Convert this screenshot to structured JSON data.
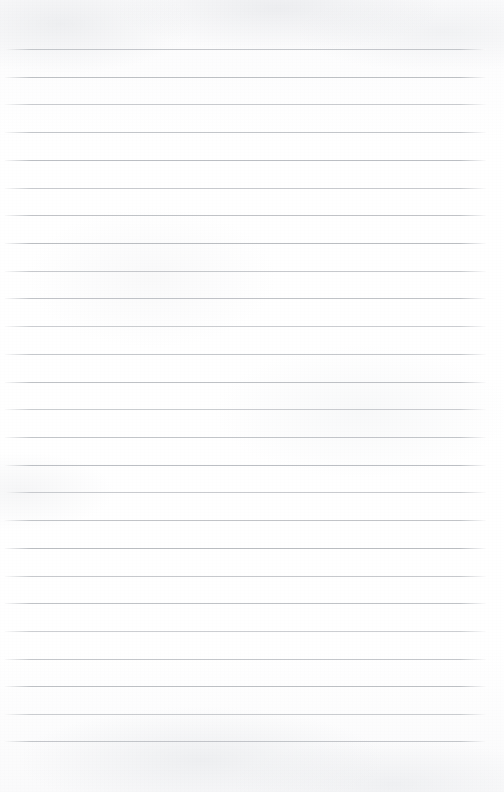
{
  "document": {
    "type": "lined-paper",
    "title": "",
    "content_text": "",
    "is_blank": true,
    "page_width": 504,
    "page_height": 792,
    "paper_color": "#fdfdfd",
    "rule_color": "#b9bcc1"
  },
  "ruling": {
    "line_count": 26,
    "first_line_y": 49,
    "line_spacing": 27.7,
    "line_start_x": 5,
    "line_end_x": 486,
    "line_thickness": 1,
    "top_margin": 49,
    "bottom_margin": 50,
    "left_margin": 5,
    "right_margin": 18,
    "has_vertical_margin_rule": false
  },
  "lines": [
    {
      "index": 1,
      "y": 49,
      "text": ""
    },
    {
      "index": 2,
      "y": 77,
      "text": ""
    },
    {
      "index": 3,
      "y": 104,
      "text": ""
    },
    {
      "index": 4,
      "y": 132,
      "text": ""
    },
    {
      "index": 5,
      "y": 160,
      "text": ""
    },
    {
      "index": 6,
      "y": 188,
      "text": ""
    },
    {
      "index": 7,
      "y": 215,
      "text": ""
    },
    {
      "index": 8,
      "y": 243,
      "text": ""
    },
    {
      "index": 9,
      "y": 271,
      "text": ""
    },
    {
      "index": 10,
      "y": 298,
      "text": ""
    },
    {
      "index": 11,
      "y": 326,
      "text": ""
    },
    {
      "index": 12,
      "y": 354,
      "text": ""
    },
    {
      "index": 13,
      "y": 382,
      "text": ""
    },
    {
      "index": 14,
      "y": 409,
      "text": ""
    },
    {
      "index": 15,
      "y": 437,
      "text": ""
    },
    {
      "index": 16,
      "y": 465,
      "text": ""
    },
    {
      "index": 17,
      "y": 492,
      "text": ""
    },
    {
      "index": 18,
      "y": 520,
      "text": ""
    },
    {
      "index": 19,
      "y": 548,
      "text": ""
    },
    {
      "index": 20,
      "y": 576,
      "text": ""
    },
    {
      "index": 21,
      "y": 603,
      "text": ""
    },
    {
      "index": 22,
      "y": 631,
      "text": ""
    },
    {
      "index": 23,
      "y": 659,
      "text": ""
    },
    {
      "index": 24,
      "y": 686,
      "text": ""
    },
    {
      "index": 25,
      "y": 714,
      "text": ""
    },
    {
      "index": 26,
      "y": 741,
      "text": ""
    }
  ]
}
